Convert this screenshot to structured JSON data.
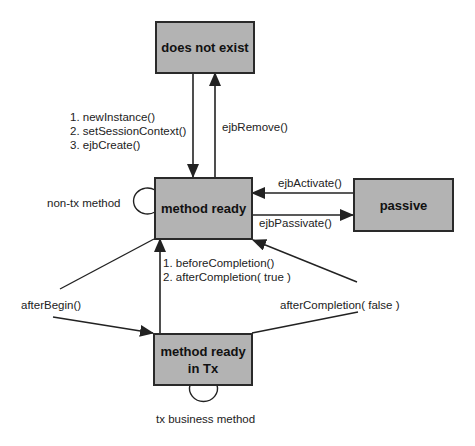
{
  "colors": {
    "state_fill": "#b3b3b3",
    "state_border": "#2a2a2a",
    "line": "#222222",
    "background": "#ffffff"
  },
  "states": {
    "does_not_exist": "does not exist",
    "method_ready": "method ready",
    "passive": "passive",
    "method_ready_in_tx_line1": "method ready",
    "method_ready_in_tx_line2": "in Tx"
  },
  "transitions": {
    "create_1": "1. newInstance()",
    "create_2": "2. setSessionContext()",
    "create_3": "3. ejbCreate()",
    "remove": "ejbRemove()",
    "non_tx": "non-tx method",
    "activate": "ejbActivate()",
    "passivate": "ejbPassivate()",
    "commit_1": "1. beforeCompletion()",
    "commit_2": "2. afterCompletion( true )",
    "after_begin": "afterBegin()",
    "rollback": "afterCompletion( false )",
    "tx_business": "tx business method"
  }
}
